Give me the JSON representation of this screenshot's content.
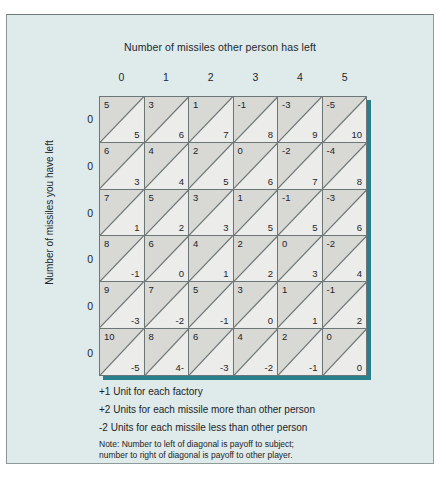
{
  "chart_data": {
    "type": "table",
    "title": "Number of missiles other person has left",
    "xlabel": "Number of missiles other person has left",
    "ylabel": "Number of missiles you have left",
    "column_headers": [
      "0",
      "1",
      "2",
      "3",
      "4",
      "5"
    ],
    "row_headers": [
      "0",
      "0",
      "0",
      "0",
      "0",
      "0"
    ],
    "cell_note": "Each cell is split by a diagonal: upper-left number is payoff to subject, lower-right number is payoff to other player.",
    "rows": [
      {
        "self": [
          "5",
          "3",
          "1",
          "-1",
          "-3",
          "-5"
        ],
        "other": [
          "5",
          "6",
          "7",
          "8",
          "9",
          "10"
        ]
      },
      {
        "self": [
          "6",
          "4",
          "2",
          "0",
          "-2",
          "-4"
        ],
        "other": [
          "3",
          "4",
          "5",
          "6",
          "7",
          "8"
        ]
      },
      {
        "self": [
          "7",
          "5",
          "3",
          "1",
          "-1",
          "-3"
        ],
        "other": [
          "1",
          "2",
          "3",
          "5",
          "5",
          "6"
        ]
      },
      {
        "self": [
          "8",
          "6",
          "4",
          "2",
          "0",
          "-2"
        ],
        "other": [
          "-1",
          "0",
          "1",
          "2",
          "3",
          "4"
        ]
      },
      {
        "self": [
          "9",
          "7",
          "5",
          "3",
          "1",
          "-1"
        ],
        "other": [
          "-3",
          "-2",
          "-1",
          "0",
          "1",
          "2"
        ]
      },
      {
        "self": [
          "10",
          "8",
          "6",
          "4",
          "2",
          "0"
        ],
        "other": [
          "-5",
          "4-",
          "-3",
          "-2",
          "-1",
          "0"
        ]
      }
    ],
    "legend": [
      "+1 Unit for each factory",
      "+2 Units for each missile more than other person",
      "-2 Units for each missile less than other person"
    ],
    "note": [
      "Note: Number to left of diagonal is payoff to subject;",
      "number to right of diagonal is payoff to other player."
    ],
    "colors": {
      "panel_background": "#dfeaea",
      "panel_border": "#8f9a9a",
      "cell_light": "#ececeb",
      "cell_dark": "#d8d8d5",
      "grid_line": "#6d7676",
      "shadow": "#2a7f8c",
      "text": "#1d2427"
    }
  }
}
